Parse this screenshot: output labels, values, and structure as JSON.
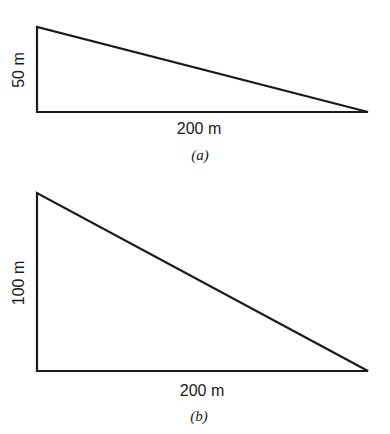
{
  "figure_a": {
    "vertical_label": "50 m",
    "horizontal_label": "200 m",
    "caption": "(a)"
  },
  "figure_b": {
    "vertical_label": "100 m",
    "horizontal_label": "200 m",
    "caption": "(b)"
  },
  "colors": {
    "stroke": "#1a1a1a",
    "background": "#ffffff"
  }
}
